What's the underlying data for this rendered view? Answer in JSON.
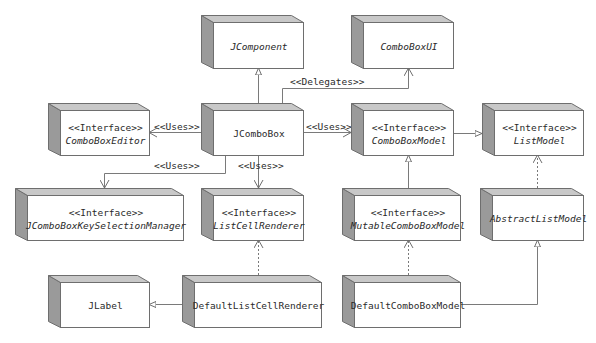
{
  "diagram": {
    "colors": {
      "side_face": "#9a9a9a",
      "top_face": "#c8c8c8",
      "front_face": "#ffffff",
      "stroke": "#6e6e6e",
      "text": "#2a2a2a"
    },
    "nodes": [
      {
        "id": "jcomponent",
        "stereotype": "",
        "name": "JComponent",
        "italic": true
      },
      {
        "id": "comboboxui",
        "stereotype": "",
        "name": "ComboBoxUI",
        "italic": true
      },
      {
        "id": "comboboxeditor",
        "stereotype": "<<Interface>>",
        "name": "ComboBoxEditor",
        "italic": true
      },
      {
        "id": "jcombobox",
        "stereotype": "",
        "name": "JComboBox",
        "italic": false
      },
      {
        "id": "comboboxmodel",
        "stereotype": "<<Interface>>",
        "name": "ComboBoxModel",
        "italic": true
      },
      {
        "id": "listmodel",
        "stereotype": "<<Interface>>",
        "name": "ListModel",
        "italic": true
      },
      {
        "id": "keyselectionmanager",
        "stereotype": "<<Interface>>",
        "name": "JComboBoxKeySelectionManager",
        "italic": true
      },
      {
        "id": "listcellrenderer",
        "stereotype": "<<Interface>>",
        "name": "ListCellRenderer",
        "italic": true
      },
      {
        "id": "mutablecomboboxmodel",
        "stereotype": "<<Interface>>",
        "name": "MutableComboBoxModel",
        "italic": true
      },
      {
        "id": "abstractlistmodel",
        "stereotype": "",
        "name": "AbstractListModel",
        "italic": true
      },
      {
        "id": "jlabel",
        "stereotype": "",
        "name": "JLabel",
        "italic": false
      },
      {
        "id": "defaultlistcellrenderer",
        "stereotype": "",
        "name": "DefaultListCellRenderer",
        "italic": false
      },
      {
        "id": "defaultcomboboxmodel",
        "stereotype": "",
        "name": "DefaultComboBoxModel",
        "italic": false
      }
    ],
    "edges": [
      {
        "from": "JComboBox",
        "to": "JComponent",
        "type": "generalization",
        "label": ""
      },
      {
        "from": "JComboBox",
        "to": "ComboBoxUI",
        "type": "dependency",
        "label": "<<Delegates>>"
      },
      {
        "from": "JComboBox",
        "to": "ComboBoxEditor",
        "type": "association",
        "label": "<<Uses>>"
      },
      {
        "from": "JComboBox",
        "to": "ComboBoxModel",
        "type": "association",
        "label": "<<Uses>>"
      },
      {
        "from": "JComboBox",
        "to": "JComboBoxKeySelectionManager",
        "type": "association",
        "label": "<<Uses>>"
      },
      {
        "from": "JComboBox",
        "to": "ListCellRenderer",
        "type": "association",
        "label": "<<Uses>>"
      },
      {
        "from": "ComboBoxModel",
        "to": "ListModel",
        "type": "generalization",
        "label": ""
      },
      {
        "from": "MutableComboBoxModel",
        "to": "ComboBoxModel",
        "type": "generalization",
        "label": ""
      },
      {
        "from": "AbstractListModel",
        "to": "ListModel",
        "type": "realization",
        "label": ""
      },
      {
        "from": "DefaultListCellRenderer",
        "to": "ListCellRenderer",
        "type": "realization",
        "label": ""
      },
      {
        "from": "DefaultListCellRenderer",
        "to": "JLabel",
        "type": "generalization",
        "label": ""
      },
      {
        "from": "DefaultComboBoxModel",
        "to": "MutableComboBoxModel",
        "type": "realization",
        "label": ""
      },
      {
        "from": "DefaultComboBoxModel",
        "to": "AbstractListModel",
        "type": "generalization",
        "label": ""
      }
    ],
    "edge_labels": {
      "delegates": "<<Delegates>>",
      "uses_editor": "<<Uses>>",
      "uses_model": "<<Uses>>",
      "uses_keyselection": "<<Uses>>",
      "uses_renderer": "<<Uses>>"
    }
  }
}
